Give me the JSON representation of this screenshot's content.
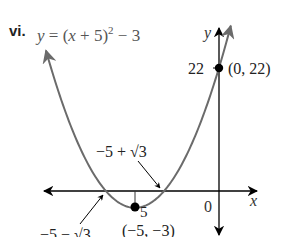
{
  "problem_label": "vi.",
  "chart_data": {
    "type": "line",
    "equation_display": {
      "lhs": "y",
      "eq": " = (",
      "var": "x",
      "mid": " + 5)",
      "exp": "2",
      "tail": " − 3"
    },
    "function": "y = (x + 5)^2 - 3",
    "xlabel": "x",
    "ylabel": "y",
    "origin_label": "0",
    "y_tick_label": "22",
    "vertex_tick_label": "5",
    "series": [
      {
        "name": "y = (x + 5)^2 - 3",
        "color": "#6b6b6b",
        "x_range": [
          -10.3,
          0.7
        ]
      }
    ],
    "key_points": [
      {
        "name": "y-intercept",
        "x": 0,
        "y": 22,
        "label": "(0, 22)"
      },
      {
        "name": "vertex",
        "x": -5,
        "y": -3,
        "label": "(−5, −3)"
      }
    ],
    "annotations": [
      {
        "name": "right-root",
        "x": -3.268,
        "y": 0,
        "label": "−5 + √3"
      },
      {
        "name": "left-root",
        "x": -6.732,
        "y": 0,
        "label": "−5 − √3"
      }
    ],
    "xlim": [
      -10.5,
      2.3
    ],
    "ylim": [
      -8,
      29
    ],
    "grid": false,
    "axis_color": "#000000",
    "curve_color": "#6b6b6b"
  }
}
